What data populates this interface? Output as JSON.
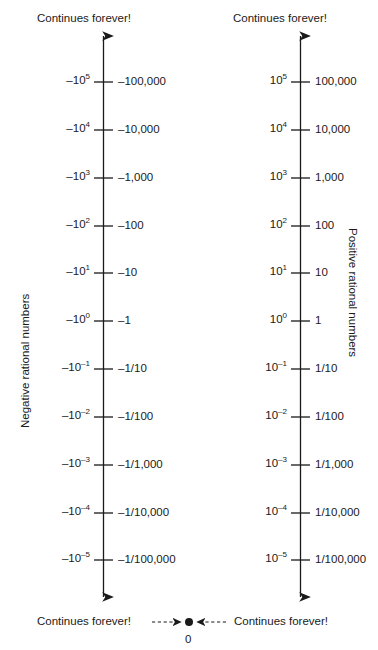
{
  "diagram": {
    "title_top_left": "Continues forever!",
    "title_top_right": "Continues forever!",
    "title_bottom_left": "Continues forever!",
    "title_bottom_right": "Continues forever!",
    "axis_label_left": "Negative rational numbers",
    "axis_label_right": "Positive rational numbers",
    "zero_label": "0",
    "line_color": "#1a1a1a",
    "text_color": "#1a1a1a",
    "background_color": "#ffffff"
  },
  "chart_data": {
    "type": "line",
    "xlabel": "",
    "ylabel": "",
    "grid": false,
    "legend": "none",
    "axes": [
      {
        "name": "negative",
        "label": "Negative rational numbers",
        "top_note": "Continues forever!",
        "bottom_note": "Continues forever!",
        "direction": "values decrease in magnitude downward toward 0",
        "exponents": [
          5,
          4,
          3,
          2,
          1,
          0,
          -1,
          -2,
          -3,
          -4,
          -5
        ],
        "power_labels": [
          "−10⁵",
          "−10⁴",
          "−10³",
          "−10²",
          "−10¹",
          "−10⁰",
          "−10⁻¹",
          "−10⁻²",
          "−10⁻³",
          "−10⁻⁴",
          "−10⁻⁵"
        ],
        "value_labels": [
          "–100,000",
          "–10,000",
          "–1,000",
          "–100",
          "–10",
          "–1",
          "–1/10",
          "–1/100",
          "–1/1,000",
          "–1/10,000",
          "–1/100,000"
        ],
        "values": [
          -100000,
          -10000,
          -1000,
          -100,
          -10,
          -1,
          -0.1,
          -0.01,
          -0.001,
          -0.0001,
          -1e-05
        ]
      },
      {
        "name": "positive",
        "label": "Positive rational numbers",
        "top_note": "Continues forever!",
        "bottom_note": "Continues forever!",
        "direction": "values decrease in magnitude downward toward 0",
        "exponents": [
          5,
          4,
          3,
          2,
          1,
          0,
          -1,
          -2,
          -3,
          -4,
          -5
        ],
        "power_labels": [
          "10⁵",
          "10⁴",
          "10³",
          "10²",
          "10¹",
          "10⁰",
          "10⁻¹",
          "10⁻²",
          "10⁻³",
          "10⁻⁴",
          "10⁻⁵"
        ],
        "value_labels": [
          "100,000",
          "10,000",
          "1,000",
          "100",
          "10",
          "1",
          "1/10",
          "1/100",
          "1/1,000",
          "1/10,000",
          "1/100,000"
        ],
        "values": [
          100000,
          10000,
          1000,
          100,
          10,
          1,
          0.1,
          0.01,
          0.001,
          0.0001,
          1e-05
        ]
      }
    ],
    "convergence_point": {
      "label": "0",
      "value": 0,
      "note": "Both lines approach zero; dashed arrows point inward to the filled dot at 0."
    }
  },
  "rows": [
    {
      "neg_base": "–10",
      "neg_exp": "5",
      "neg_val": "–100,000",
      "pos_base": "10",
      "pos_exp": "5",
      "pos_val": "100,000"
    },
    {
      "neg_base": "–10",
      "neg_exp": "4",
      "neg_val": "–10,000",
      "pos_base": "10",
      "pos_exp": "4",
      "pos_val": "10,000"
    },
    {
      "neg_base": "–10",
      "neg_exp": "3",
      "neg_val": "–1,000",
      "pos_base": "10",
      "pos_exp": "3",
      "pos_val": "1,000"
    },
    {
      "neg_base": "–10",
      "neg_exp": "2",
      "neg_val": "–100",
      "pos_base": "10",
      "pos_exp": "2",
      "pos_val": "100"
    },
    {
      "neg_base": "–10",
      "neg_exp": "1",
      "neg_val": "–10",
      "pos_base": "10",
      "pos_exp": "1",
      "pos_val": "10"
    },
    {
      "neg_base": "–10",
      "neg_exp": "0",
      "neg_val": "–1",
      "pos_base": "10",
      "pos_exp": "0",
      "pos_val": "1"
    },
    {
      "neg_base": "–10",
      "neg_exp": "–1",
      "neg_val": "–1/10",
      "pos_base": "10",
      "pos_exp": "–1",
      "pos_val": "1/10"
    },
    {
      "neg_base": "–10",
      "neg_exp": "–2",
      "neg_val": "–1/100",
      "pos_base": "10",
      "pos_exp": "–2",
      "pos_val": "1/100"
    },
    {
      "neg_base": "–10",
      "neg_exp": "–3",
      "neg_val": "–1/1,000",
      "pos_base": "10",
      "pos_exp": "–3",
      "pos_val": "1/1,000"
    },
    {
      "neg_base": "–10",
      "neg_exp": "–4",
      "neg_val": "–1/10,000",
      "pos_base": "10",
      "pos_exp": "–4",
      "pos_val": "1/10,000"
    },
    {
      "neg_base": "–10",
      "neg_exp": "–5",
      "neg_val": "–1/100,000",
      "pos_base": "10",
      "pos_exp": "–5",
      "pos_val": "1/100,000"
    }
  ]
}
